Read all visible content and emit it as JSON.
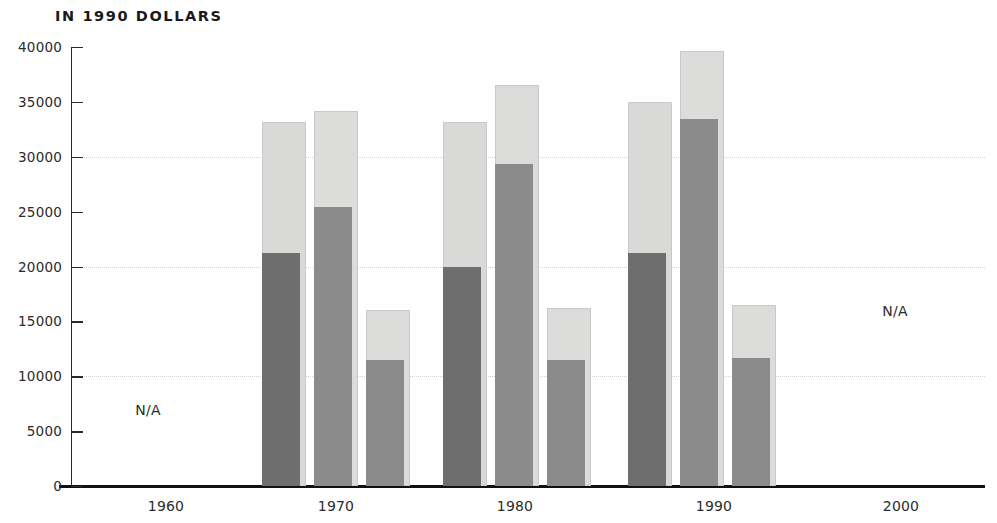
{
  "chart_data": {
    "type": "bar",
    "title": "IN 1990 DOLLARS",
    "subtitle": "",
    "xlabel": "",
    "ylabel": "",
    "categories": [
      "1960",
      "1970",
      "1980",
      "1990",
      "2000"
    ],
    "ylim": [
      0,
      40000
    ],
    "ytick_labels": [
      "0",
      "5000",
      "10000",
      "15000",
      "20000",
      "25000",
      "30000",
      "35000",
      "40000"
    ],
    "ytick_values": [
      0,
      5000,
      10000,
      15000,
      20000,
      25000,
      30000,
      35000,
      40000
    ],
    "gridlines_at": [
      10000,
      20000,
      30000
    ],
    "grid": true,
    "legend": "none",
    "na_marker": "N/A",
    "series": [
      {
        "name": "bar-1-dark",
        "role": "lower value",
        "color": "#6e6e6e",
        "values": [
          null,
          21200,
          20000,
          21200,
          null
        ]
      },
      {
        "name": "bar-1-light",
        "role": "upper value",
        "color": "#d9d9d7",
        "values": [
          null,
          33200,
          33200,
          35000,
          null
        ]
      },
      {
        "name": "bar-2-dark",
        "role": "lower value",
        "color": "#8b8b8b",
        "values": [
          null,
          25400,
          29300,
          33400,
          null
        ]
      },
      {
        "name": "bar-2-light",
        "role": "upper value",
        "color": "#d9d9d7",
        "values": [
          null,
          34200,
          36500,
          39600,
          null
        ]
      },
      {
        "name": "bar-3-dark",
        "role": "lower value",
        "color": "#8b8b8b",
        "values": [
          null,
          11500,
          11500,
          11700,
          null
        ]
      },
      {
        "name": "bar-3-light",
        "role": "upper value",
        "color": "#d9d9d7",
        "values": [
          null,
          16000,
          16200,
          16500,
          null
        ]
      }
    ],
    "groups": [
      {
        "category": "1960",
        "available": false,
        "na_label": "N/A",
        "bars": []
      },
      {
        "category": "1970",
        "available": true,
        "bars": [
          {
            "name": "bar-1",
            "dark": 21200,
            "light": 33200,
            "dark_color": "#6e6e6e",
            "light_color": "#d9d9d7"
          },
          {
            "name": "bar-2",
            "dark": 25400,
            "light": 34200,
            "dark_color": "#8b8b8b",
            "light_color": "#dcdcda"
          },
          {
            "name": "bar-3",
            "dark": 11500,
            "light": 16000,
            "dark_color": "#8b8b8b",
            "light_color": "#dcdcda"
          }
        ]
      },
      {
        "category": "1980",
        "available": true,
        "bars": [
          {
            "name": "bar-1",
            "dark": 20000,
            "light": 33200,
            "dark_color": "#6e6e6e",
            "light_color": "#d9d9d7"
          },
          {
            "name": "bar-2",
            "dark": 29300,
            "light": 36500,
            "dark_color": "#8b8b8b",
            "light_color": "#dcdcda"
          },
          {
            "name": "bar-3",
            "dark": 11500,
            "light": 16200,
            "dark_color": "#8b8b8b",
            "light_color": "#dcdcda"
          }
        ]
      },
      {
        "category": "1990",
        "available": true,
        "bars": [
          {
            "name": "bar-1",
            "dark": 21200,
            "light": 35000,
            "dark_color": "#6e6e6e",
            "light_color": "#d9d9d7"
          },
          {
            "name": "bar-2",
            "dark": 33400,
            "light": 39600,
            "dark_color": "#8b8b8b",
            "light_color": "#dcdcda"
          },
          {
            "name": "bar-3",
            "dark": 11700,
            "light": 16500,
            "dark_color": "#8b8b8b",
            "light_color": "#dcdcda"
          }
        ]
      },
      {
        "category": "2000",
        "available": false,
        "na_label": "N/A",
        "bars": []
      }
    ]
  },
  "axis": {
    "y_ticks": [
      {
        "label": "40000",
        "value": 40000
      },
      {
        "label": "35000",
        "value": 35000
      },
      {
        "label": "30000",
        "value": 30000
      },
      {
        "label": "25000",
        "value": 25000
      },
      {
        "label": "20000",
        "value": 20000
      },
      {
        "label": "15000",
        "value": 15000
      },
      {
        "label": "10000",
        "value": 10000
      },
      {
        "label": "5000",
        "value": 5000
      },
      {
        "label": "0",
        "value": 0
      }
    ],
    "x_ticks": [
      {
        "label": "1960",
        "center": 166
      },
      {
        "label": "1970",
        "center": 336
      },
      {
        "label": "1980",
        "center": 515
      },
      {
        "label": "1990",
        "center": 714
      },
      {
        "label": "2000",
        "center": 901
      }
    ]
  },
  "annotations": [
    {
      "text": "N/A",
      "x": 148,
      "y": 410
    },
    {
      "text": "N/A",
      "x": 895,
      "y": 311
    }
  ],
  "colors": {
    "dark_primary": "#6e6e6e",
    "dark_secondary": "#8b8b8b",
    "light_segment": "#d9d9d7",
    "axis": "#2b2b2b",
    "baseline": "#111111",
    "gridline": "#d6d2cf",
    "text": "#231f20"
  }
}
